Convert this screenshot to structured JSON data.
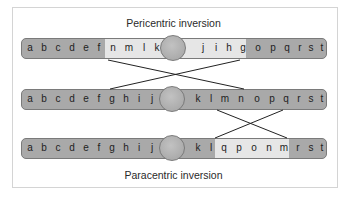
{
  "figure": {
    "top_title": "Pericentric inversion",
    "bottom_title": "Paracentric inversion",
    "chromosomes": [
      {
        "name": "pericentric-inverted",
        "left_arm": [
          "a",
          "b",
          "c",
          "d",
          "e",
          "f",
          "n",
          "m",
          "l",
          "k"
        ],
        "right_arm": [
          "j",
          "i",
          "h",
          "g",
          "o",
          "p",
          "q",
          "r",
          "s",
          "t"
        ],
        "inverted_genes": [
          "n",
          "m",
          "l",
          "k",
          "j",
          "i",
          "h",
          "g"
        ]
      },
      {
        "name": "normal",
        "left_arm": [
          "a",
          "b",
          "c",
          "d",
          "e",
          "f",
          "g",
          "h",
          "i",
          "j"
        ],
        "right_arm": [
          "k",
          "l",
          "m",
          "n",
          "o",
          "p",
          "q",
          "r",
          "s",
          "t"
        ],
        "inverted_genes": []
      },
      {
        "name": "paracentric-inverted",
        "left_arm": [
          "a",
          "b",
          "c",
          "d",
          "e",
          "f",
          "g",
          "h",
          "i",
          "j"
        ],
        "right_arm": [
          "k",
          "l",
          "q",
          "p",
          "o",
          "n",
          "m",
          "r",
          "s",
          "t"
        ],
        "inverted_genes": [
          "q",
          "p",
          "o",
          "n",
          "m"
        ]
      }
    ],
    "colors": {
      "chromosome": "#a9a9a9",
      "inverted_segment": "#e6e6e6",
      "outline": "#7a7a7a",
      "lines": "#222222"
    }
  }
}
